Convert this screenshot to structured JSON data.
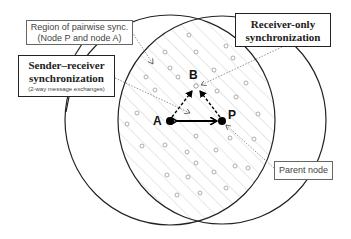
{
  "diagram": {
    "labels": {
      "region_box": {
        "line1": "Region of pairwise sync.",
        "line2": "(Node P and node A)"
      },
      "sender_box": {
        "line1": "Sender–receiver",
        "line2": "synchronization",
        "line3": "(2-way message exchanges)"
      },
      "receiver_box": {
        "line1": "Receiver-only",
        "line2": "synchronization"
      },
      "parent_box": {
        "text": "Parent node"
      }
    },
    "nodes": [
      {
        "id": "A",
        "label": "A",
        "x": 170,
        "y": 121,
        "type": "sender"
      },
      {
        "id": "P",
        "label": "P",
        "x": 222,
        "y": 121,
        "type": "parent"
      },
      {
        "id": "B",
        "label": "B",
        "x": 196,
        "y": 86,
        "type": "receiver"
      }
    ],
    "edges": [
      {
        "from": "A",
        "to": "P",
        "style": "solid",
        "direction": "both"
      },
      {
        "from": "A",
        "to": "B",
        "style": "dashed",
        "direction": "forward"
      },
      {
        "from": "P",
        "to": "B",
        "style": "dashed",
        "direction": "forward"
      }
    ],
    "colors": {
      "circle_stroke": "#222222",
      "hatch": "#c8c8c8",
      "dot": "#9a9a9a",
      "node_fill": "#000000"
    }
  }
}
